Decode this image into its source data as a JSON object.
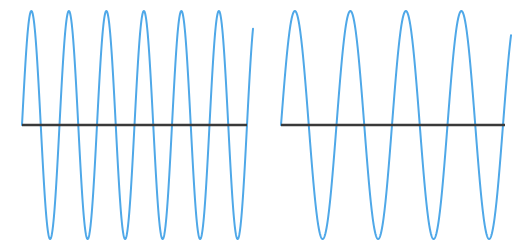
{
  "figure": {
    "background_color": "#ffffff",
    "width": 521,
    "height": 248
  },
  "style": {
    "wave_color": "#4FA8E8",
    "wave_stroke_width": 2,
    "axis_color": "#3A3A3A",
    "axis_stroke_width": 2.5
  },
  "chart_data": {
    "type": "line",
    "subtitle": "",
    "xlabel": "",
    "ylabel": "",
    "grid": false,
    "legend_position": "none",
    "axis_ticks": [],
    "tick_labels": [],
    "annotations": [],
    "panels": [
      {
        "name": "left-waveform",
        "label": "High frequency sine wave",
        "waveform": "sine",
        "cycles": 6,
        "amplitude": 114,
        "period_px": 37.5,
        "phase": 0,
        "plot_x_start": 22,
        "plot_x_end": 247,
        "baseline_y": 125,
        "peak_y": 11,
        "trough_y": 239,
        "axis_x_start": 22,
        "axis_x_end": 247,
        "wave_x_end": 253
      },
      {
        "name": "right-waveform",
        "label": "Low frequency sine wave",
        "waveform": "sine",
        "cycles": 4,
        "amplitude": 114,
        "period_px": 55.5,
        "phase": 0,
        "plot_x_start": 281,
        "plot_x_end": 503,
        "baseline_y": 125,
        "peak_y": 11,
        "trough_y": 239,
        "axis_x_start": 281,
        "axis_x_end": 505,
        "wave_x_end": 511
      }
    ]
  }
}
